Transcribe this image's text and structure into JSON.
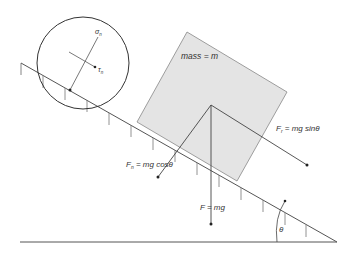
{
  "diagram": {
    "labels": {
      "mass": "mass = m",
      "friction_force": "F = mg sinθ",
      "friction_sub": "r",
      "normal_force": "F = mg cosθ",
      "normal_sub": "n",
      "weight_force": "F = mg",
      "angle": "θ",
      "normal_stress": "σ",
      "normal_stress_sub": "n",
      "shear_stress": "τ",
      "shear_stress_sub": "n"
    },
    "colors": {
      "block_fill": "#e4e4e4",
      "line": "#444444",
      "block_edge": "#777777"
    }
  }
}
